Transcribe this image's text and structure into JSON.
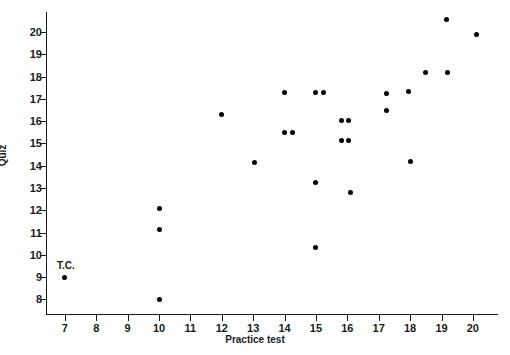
{
  "chart_data": {
    "type": "scatter",
    "title": "",
    "xlabel": "Practice test",
    "ylabel": "Quiz",
    "xlim": [
      6.4,
      20.8
    ],
    "ylim": [
      7.3,
      20.9
    ],
    "xticks": [
      7,
      8,
      9,
      10,
      11,
      12,
      13,
      14,
      15,
      16,
      17,
      18,
      19,
      20
    ],
    "yticks": [
      8,
      9,
      10,
      11,
      12,
      13,
      14,
      15,
      16,
      17,
      18,
      19,
      20
    ],
    "grid": false,
    "legend": null,
    "marker": "filled-circle",
    "marker_color": "#000000",
    "points": [
      {
        "x": 7.0,
        "y": 9.0,
        "label": "T.C."
      },
      {
        "x": 10.0,
        "y": 12.1,
        "label": ""
      },
      {
        "x": 10.0,
        "y": 11.15,
        "label": ""
      },
      {
        "x": 10.0,
        "y": 8.0,
        "label": ""
      },
      {
        "x": 12.0,
        "y": 16.3,
        "label": ""
      },
      {
        "x": 13.05,
        "y": 14.15,
        "label": ""
      },
      {
        "x": 14.0,
        "y": 17.3,
        "label": ""
      },
      {
        "x": 14.0,
        "y": 15.5,
        "label": ""
      },
      {
        "x": 14.25,
        "y": 15.5,
        "label": ""
      },
      {
        "x": 15.0,
        "y": 17.3,
        "label": ""
      },
      {
        "x": 15.25,
        "y": 17.3,
        "label": ""
      },
      {
        "x": 15.0,
        "y": 13.25,
        "label": ""
      },
      {
        "x": 15.0,
        "y": 10.35,
        "label": ""
      },
      {
        "x": 15.8,
        "y": 16.05,
        "label": ""
      },
      {
        "x": 16.05,
        "y": 16.05,
        "label": ""
      },
      {
        "x": 15.8,
        "y": 15.15,
        "label": ""
      },
      {
        "x": 16.05,
        "y": 15.15,
        "label": ""
      },
      {
        "x": 16.1,
        "y": 12.8,
        "label": ""
      },
      {
        "x": 17.25,
        "y": 17.25,
        "label": ""
      },
      {
        "x": 17.25,
        "y": 16.5,
        "label": ""
      },
      {
        "x": 17.95,
        "y": 17.35,
        "label": ""
      },
      {
        "x": 18.0,
        "y": 14.2,
        "label": ""
      },
      {
        "x": 18.5,
        "y": 18.2,
        "label": ""
      },
      {
        "x": 19.2,
        "y": 18.2,
        "label": ""
      },
      {
        "x": 19.15,
        "y": 20.55,
        "label": ""
      },
      {
        "x": 20.1,
        "y": 19.9,
        "label": ""
      }
    ]
  }
}
